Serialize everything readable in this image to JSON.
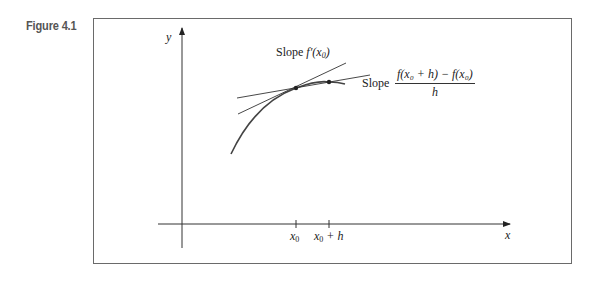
{
  "figure": {
    "label": "Figure 4.1"
  },
  "axes": {
    "x_label": "x",
    "y_label": "y"
  },
  "ticks": {
    "x0": "x",
    "x0_sub": "0",
    "x0h_main": "x",
    "x0h_sub": "0",
    "x0h_rest": " + h"
  },
  "annotations": {
    "tangent_prefix": "Slope ",
    "tangent_expr": "f′(x",
    "tangent_sub": "0",
    "tangent_close": ")",
    "secant_prefix": "Slope",
    "secant_numerator": "f(x₀ + h) − f(x₀)",
    "secant_denominator": "h"
  },
  "colors": {
    "line": "#333333",
    "frame": "#6a6a6a",
    "label": "#555555"
  }
}
